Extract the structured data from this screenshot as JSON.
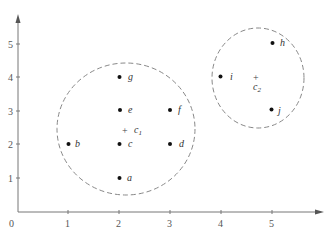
{
  "diagram": {
    "title": "",
    "axes": {
      "origin_label": "0",
      "x_ticks": [
        "1",
        "2",
        "3",
        "4",
        "5"
      ],
      "y_ticks": [
        "1",
        "2",
        "3",
        "4",
        "5"
      ]
    },
    "points": [
      {
        "label": "a",
        "x": 2,
        "y": 1
      },
      {
        "label": "b",
        "x": 1,
        "y": 2
      },
      {
        "label": "c",
        "x": 2,
        "y": 2
      },
      {
        "label": "d",
        "x": 3,
        "y": 2
      },
      {
        "label": "e",
        "x": 2,
        "y": 3
      },
      {
        "label": "f",
        "x": 3,
        "y": 3
      },
      {
        "label": "g",
        "x": 2,
        "y": 4
      },
      {
        "label": "h",
        "x": 5,
        "y": 5
      },
      {
        "label": "i",
        "x": 4,
        "y": 4
      },
      {
        "label": "j",
        "x": 5,
        "y": 3
      }
    ],
    "centroids": [
      {
        "label": "c",
        "sub": "1",
        "x": 2.14,
        "y": 2.43
      },
      {
        "label": "c",
        "sub": "2",
        "x": 4.67,
        "y": 4.0
      }
    ],
    "clusters": [
      {
        "name": "cluster-1",
        "members": [
          "a",
          "b",
          "c",
          "d",
          "e",
          "f",
          "g"
        ],
        "style": "dashed"
      },
      {
        "name": "cluster-2",
        "members": [
          "h",
          "i",
          "j"
        ],
        "style": "dashed"
      }
    ],
    "colors": {
      "axis": "#777777",
      "circle": "#888888",
      "point": "#111111",
      "text": "#333333"
    }
  }
}
